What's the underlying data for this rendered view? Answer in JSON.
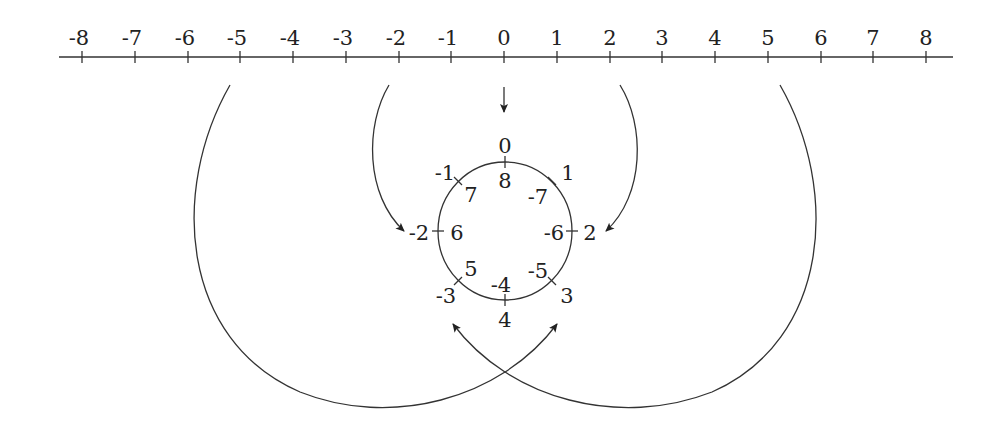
{
  "number_line": {
    "min": -8,
    "max": 8,
    "labels": [
      "-8",
      "-7",
      "-6",
      "-5",
      "-4",
      "-3",
      "-2",
      "-1",
      "0",
      "1",
      "2",
      "3",
      "4",
      "5",
      "6",
      "7",
      "8"
    ]
  },
  "circle": {
    "positions": [
      {
        "outer": "0",
        "inner": "8"
      },
      {
        "outer": "1",
        "inner": "-7"
      },
      {
        "outer": "2",
        "inner": "-6"
      },
      {
        "outer": "3",
        "inner": "-5"
      },
      {
        "outer": "4",
        "inner": "-4"
      },
      {
        "outer": "-3",
        "inner": "5"
      },
      {
        "outer": "-2",
        "inner": "6"
      },
      {
        "outer": "-1",
        "inner": "7"
      }
    ]
  },
  "arrows": [
    {
      "from": "0",
      "to": "circle-0"
    },
    {
      "from": "-2",
      "to": "circle-(-2)"
    },
    {
      "from": "2",
      "to": "circle-2"
    },
    {
      "from": "-5",
      "to": "circle-3"
    },
    {
      "from": "5",
      "to": "circle-(-3)"
    }
  ],
  "stroke_color": "#333333"
}
